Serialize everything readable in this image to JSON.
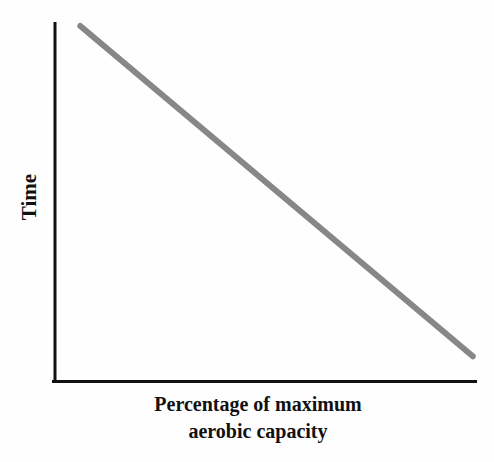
{
  "labels": {
    "ylabel": "Time",
    "xlabel_line1": "Percentage of maximum",
    "xlabel_line2": "aerobic capacity"
  },
  "colors": {
    "axis": "#111111",
    "text": "#111111",
    "data_line": "#878787",
    "background": "#fefefe"
  },
  "chart_data": {
    "type": "line",
    "title": "",
    "xlabel": "Percentage of maximum aerobic capacity",
    "ylabel": "Time",
    "x_tick_labels": [],
    "y_tick_labels": [],
    "xlim": [
      0,
      100
    ],
    "ylim": [
      0,
      100
    ],
    "grid": false,
    "legend": false,
    "annotation": "straight monotonically decreasing line; no numeric ticks shown",
    "series": [
      {
        "name": "time-vs-percent-aerobic-capacity",
        "x": [
          6,
          99
        ],
        "y": [
          97,
          7
        ],
        "color": "#878787",
        "stroke_width": 6
      }
    ]
  }
}
